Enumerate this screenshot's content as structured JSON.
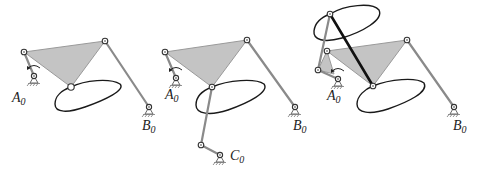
{
  "figure": {
    "panels": [
      {
        "id": "panel-1",
        "labels": {
          "a0": "A",
          "a0_sub": "0",
          "b0": "B",
          "b0_sub": "0"
        }
      },
      {
        "id": "panel-2",
        "labels": {
          "a0": "A",
          "a0_sub": "0",
          "b0": "B",
          "b0_sub": "0",
          "c0": "C",
          "c0_sub": "0"
        }
      },
      {
        "id": "panel-3",
        "labels": {
          "a0": "A",
          "a0_sub": "0",
          "b0": "B",
          "b0_sub": "0"
        }
      }
    ],
    "colors": {
      "coupler_fill": "#c4c4c4",
      "link_grey": "#8a8a8a",
      "link_black": "#111111",
      "curve": "#1a1a1a"
    }
  }
}
